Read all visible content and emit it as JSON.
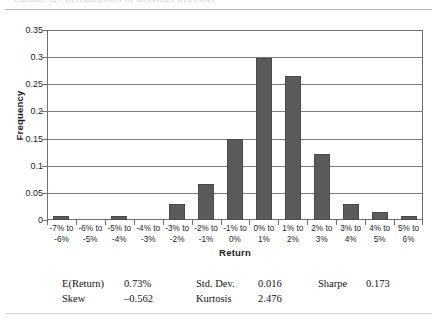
{
  "caption": {
    "text": "EXHIBIT 12.7    DISTRIBUTION OF MONTHLY RETURNS"
  },
  "chart_data": {
    "type": "bar",
    "title": "",
    "xlabel": "Return",
    "ylabel": "Frequency",
    "categories": [
      "-7% to\n-6%",
      "-6% to\n-5%",
      "-5% to\n-4%",
      "-4% to\n-3%",
      "-3% to\n-2%",
      "-2% to\n-1%",
      "-1% to\n0%",
      "0% to\n1%",
      "1% to\n2%",
      "2% to\n3%",
      "3% to\n4%",
      "4% to\n5%",
      "5% to\n6%"
    ],
    "category_lines": [
      [
        "-7% to",
        "-6%"
      ],
      [
        "-6% to",
        "-5%"
      ],
      [
        "-5% to",
        "-4%"
      ],
      [
        "-4% to",
        "-3%"
      ],
      [
        "-3% to",
        "-2%"
      ],
      [
        "-2% to",
        "-1%"
      ],
      [
        "-1% to",
        "0%"
      ],
      [
        "0% to",
        "1%"
      ],
      [
        "1% to",
        "2%"
      ],
      [
        "2% to",
        "3%"
      ],
      [
        "3% to",
        "4%"
      ],
      [
        "4% to",
        "5%"
      ],
      [
        "5% to",
        "6%"
      ]
    ],
    "values": [
      0.008,
      0.0,
      0.008,
      0.0,
      0.03,
      0.067,
      0.15,
      0.298,
      0.265,
      0.122,
      0.03,
      0.015,
      0.008
    ],
    "ylim": [
      0,
      0.35
    ],
    "ytick_labels": [
      "0",
      "0.05",
      "0.1",
      "0.15",
      "0.2",
      "0.25",
      "0.3",
      "0.35"
    ],
    "ytick_values": [
      0,
      0.05,
      0.1,
      0.15,
      0.2,
      0.25,
      0.3,
      0.35
    ],
    "grid": true,
    "legend": "none",
    "bar_color": "#5a5a5a"
  },
  "stats": {
    "rows": [
      [
        {
          "label": "E(Return)",
          "value": "0.73%"
        },
        {
          "label": "Std. Dev.",
          "value": "0.016"
        },
        {
          "label": "Sharpe",
          "value": "0.173"
        }
      ],
      [
        {
          "label": "Skew",
          "value": "–0.562"
        },
        {
          "label": "Kurtosis",
          "value": "2.476"
        },
        {
          "label": "",
          "value": ""
        }
      ]
    ]
  }
}
